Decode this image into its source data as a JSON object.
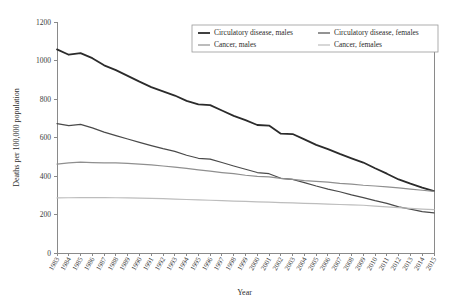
{
  "chart_data": {
    "type": "line",
    "title": "",
    "xlabel": "Year",
    "ylabel": "Deaths per 100,000 population",
    "xlim": [
      1983,
      2015
    ],
    "ylim": [
      0,
      1200
    ],
    "ytick_step": 200,
    "yticks": [
      0,
      200,
      400,
      600,
      800,
      1000,
      1200
    ],
    "grid": false,
    "legend_position": "top-center",
    "x": [
      1983,
      1984,
      1985,
      1986,
      1987,
      1988,
      1989,
      1990,
      1991,
      1992,
      1993,
      1994,
      1995,
      1996,
      1997,
      1998,
      1999,
      2000,
      2001,
      2002,
      2003,
      2004,
      2005,
      2006,
      2007,
      2008,
      2009,
      2010,
      2011,
      2012,
      2013,
      2014,
      2015
    ],
    "categories": [
      "1983",
      "1984",
      "1985",
      "1986",
      "1987",
      "1988",
      "1989",
      "1990",
      "1991",
      "1992",
      "1993",
      "1994",
      "1995",
      "1996",
      "1997",
      "1998",
      "1999",
      "2000",
      "2001",
      "2002",
      "2003",
      "2004",
      "2005",
      "2006",
      "2007",
      "2008",
      "2009",
      "2010",
      "2011",
      "2012",
      "2013",
      "2014",
      "2015"
    ],
    "series": [
      {
        "name": "Circulatory disease, males",
        "color": "#2b2b2b",
        "width": 1.8,
        "values": [
          1058,
          1030,
          1038,
          1012,
          975,
          950,
          920,
          890,
          862,
          840,
          818,
          790,
          772,
          768,
          740,
          712,
          690,
          665,
          662,
          620,
          618,
          590,
          562,
          540,
          515,
          492,
          470,
          440,
          412,
          382,
          360,
          340,
          322
        ]
      },
      {
        "name": "Circulatory disease, females",
        "color": "#4a4a4a",
        "width": 1.2,
        "values": [
          672,
          662,
          668,
          650,
          628,
          610,
          592,
          575,
          558,
          542,
          528,
          508,
          492,
          488,
          470,
          452,
          435,
          418,
          412,
          388,
          382,
          366,
          348,
          332,
          318,
          302,
          288,
          272,
          258,
          240,
          228,
          215,
          208
        ]
      },
      {
        "name": "Cancer, males",
        "color": "#8f8f8f",
        "width": 1.2,
        "values": [
          462,
          468,
          472,
          470,
          468,
          468,
          466,
          462,
          458,
          452,
          446,
          440,
          432,
          425,
          418,
          412,
          404,
          398,
          395,
          388,
          382,
          376,
          372,
          368,
          362,
          358,
          352,
          348,
          344,
          338,
          332,
          326,
          320
        ]
      },
      {
        "name": "Cancer, females",
        "color": "#bdbdbd",
        "width": 1.2,
        "values": [
          286,
          287,
          288,
          288,
          288,
          287,
          286,
          285,
          284,
          282,
          280,
          278,
          276,
          274,
          272,
          270,
          268,
          266,
          264,
          262,
          260,
          258,
          256,
          254,
          252,
          250,
          248,
          244,
          240,
          236,
          232,
          228,
          225
        ]
      }
    ]
  },
  "legend": {
    "entries": [
      {
        "label": "Circulatory disease, males"
      },
      {
        "label": "Circulatory disease, females"
      },
      {
        "label": "Cancer, males"
      },
      {
        "label": "Cancer, females"
      }
    ]
  }
}
